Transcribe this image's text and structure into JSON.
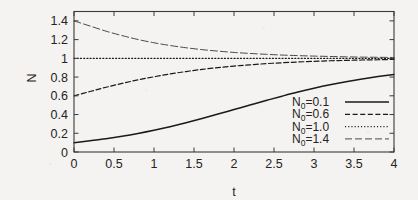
{
  "chart_data": {
    "type": "line",
    "title": "",
    "xlabel": "t",
    "ylabel": "N",
    "xlim": [
      0,
      4
    ],
    "ylim": [
      0,
      1.5
    ],
    "grid": false,
    "legend_position": "bottom-right",
    "x_ticks": [
      "0",
      "0.5",
      "1",
      "1.5",
      "2",
      "2.5",
      "3",
      "3.5",
      "4"
    ],
    "x_tick_values": [
      0,
      0.5,
      1,
      1.5,
      2,
      2.5,
      3,
      3.5,
      4
    ],
    "y_ticks": [
      "0",
      "0.2",
      "0.4",
      "0.6",
      "0.8",
      "1",
      "1.2",
      "1.4"
    ],
    "y_tick_values": [
      0,
      0.2,
      0.4,
      0.6,
      0.8,
      1.0,
      1.2,
      1.4
    ],
    "x": [
      0,
      0.2,
      0.4,
      0.6,
      0.8,
      1.0,
      1.2,
      1.4,
      1.6,
      1.8,
      2.0,
      2.2,
      2.4,
      2.6,
      2.8,
      3.0,
      3.2,
      3.4,
      3.6,
      3.8,
      4.0
    ],
    "series": [
      {
        "name": "N_0=0.1",
        "label_base": "N",
        "label_sub": "0",
        "label_rest": "=0.1",
        "style": "solid",
        "color": "#1a1a1a",
        "width": 1.5,
        "values": [
          0.1,
          0.12,
          0.142,
          0.168,
          0.198,
          0.232,
          0.27,
          0.312,
          0.357,
          0.405,
          0.453,
          0.502,
          0.55,
          0.596,
          0.64,
          0.68,
          0.717,
          0.75,
          0.779,
          0.805,
          0.828
        ]
      },
      {
        "name": "N_0=0.6",
        "label_base": "N",
        "label_sub": "0",
        "label_rest": "=0.6",
        "style": "dashed",
        "color": "#1a1a1a",
        "width": 1.2,
        "values": [
          0.6,
          0.646,
          0.691,
          0.732,
          0.77,
          0.803,
          0.833,
          0.859,
          0.882,
          0.901,
          0.917,
          0.931,
          0.943,
          0.953,
          0.961,
          0.968,
          0.974,
          0.978,
          0.982,
          0.985,
          0.988
        ]
      },
      {
        "name": "N_0=1.0",
        "label_base": "N",
        "label_sub": "0",
        "label_rest": "=1.0",
        "style": "dotted",
        "color": "#1a1a1a",
        "width": 1.2,
        "values": [
          1.0,
          1.0,
          1.0,
          1.0,
          1.0,
          1.0,
          1.0,
          1.0,
          1.0,
          1.0,
          1.0,
          1.0,
          1.0,
          1.0,
          1.0,
          1.0,
          1.0,
          1.0,
          1.0,
          1.0,
          1.0
        ]
      },
      {
        "name": "N_0=1.4",
        "label_base": "N",
        "label_sub": "0",
        "label_rest": "=1.4",
        "style": "longdash",
        "color": "#4a4a4a",
        "width": 1.0,
        "values": [
          1.4,
          1.345,
          1.29,
          1.243,
          1.201,
          1.166,
          1.137,
          1.113,
          1.093,
          1.077,
          1.063,
          1.052,
          1.043,
          1.035,
          1.029,
          1.024,
          1.02,
          1.016,
          1.013,
          1.011,
          1.009
        ]
      }
    ]
  },
  "axes": {
    "x_title": "t",
    "y_title": "N"
  },
  "legend": {
    "entries": [
      {
        "text": "N0=0.1",
        "base": "N",
        "sub": "0",
        "rest": "=0.1"
      },
      {
        "text": "N0=0.6",
        "base": "N",
        "sub": "0",
        "rest": "=0.6"
      },
      {
        "text": "N0=1.0",
        "base": "N",
        "sub": "0",
        "rest": "=1.0"
      },
      {
        "text": "N0=1.4",
        "base": "N",
        "sub": "0",
        "rest": "=1.4"
      }
    ]
  },
  "style": {
    "background": "#f4f3f1",
    "axis_color": "#3a3a3a",
    "text_color": "#242424"
  }
}
